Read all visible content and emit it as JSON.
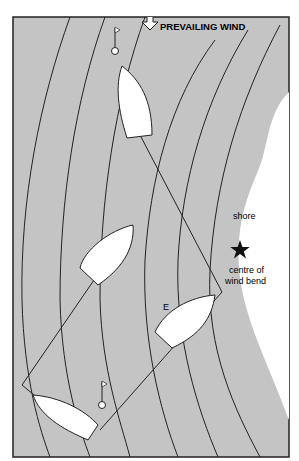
{
  "page_number": "17",
  "wind_label": "PREVAILING WIND",
  "shore_label": "shore",
  "centre_label_1": "centre of",
  "centre_label_2": "wind bend",
  "mark_label": "E",
  "colors": {
    "water": "#c4c4c4",
    "land": "#ffffff",
    "line": "#222222"
  }
}
